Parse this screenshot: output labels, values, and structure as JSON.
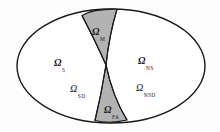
{
  "figure": {
    "name": "partition-ellipse-diagram",
    "background_color": "#fdfdfd",
    "outline_color": "#1a1a1a",
    "shaded_fill_color": "#b3b3b3",
    "unshaded_fill_color": "#ffffff"
  },
  "regions": [
    {
      "key": "omega_m",
      "symbol": "Ω",
      "subscript": "M",
      "shaded": true,
      "position": "top-center"
    },
    {
      "key": "omega_s",
      "symbol": "Ω",
      "subscript": "S",
      "shaded": false,
      "position": "left-upper"
    },
    {
      "key": "omega_ns",
      "symbol": "Ω",
      "subscript": "NS",
      "shaded": false,
      "position": "right-upper"
    },
    {
      "key": "omega_sd",
      "symbol": "Ω",
      "subscript": "SD",
      "shaded": false,
      "position": "left-lower"
    },
    {
      "key": "omega_nsd",
      "symbol": "Ω",
      "subscript": "NSD",
      "shaded": false,
      "position": "right-lower"
    },
    {
      "key": "omega_fa",
      "symbol": "Ω",
      "subscript": "FA",
      "shaded": true,
      "position": "bottom-center"
    }
  ]
}
